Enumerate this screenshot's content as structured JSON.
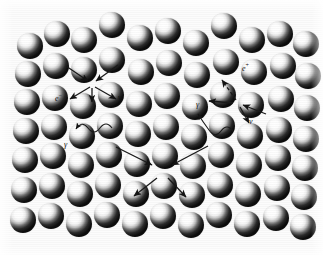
{
  "figure": {
    "background_color": "#fcfcfc",
    "width": 323,
    "height": 255,
    "sphere_color_light": "#ffffff",
    "sphere_color_dark": "#080808",
    "line_color": "#1a1a1a"
  },
  "medium": {
    "name": "sphere-lattice",
    "sphere_radius": 13,
    "spheres": [
      {
        "cx": 30,
        "cy": 46
      },
      {
        "cx": 57,
        "cy": 34
      },
      {
        "cx": 84,
        "cy": 40
      },
      {
        "cx": 112,
        "cy": 25
      },
      {
        "cx": 140,
        "cy": 38
      },
      {
        "cx": 168,
        "cy": 31
      },
      {
        "cx": 196,
        "cy": 43
      },
      {
        "cx": 224,
        "cy": 26
      },
      {
        "cx": 252,
        "cy": 40
      },
      {
        "cx": 280,
        "cy": 34
      },
      {
        "cx": 306,
        "cy": 44
      },
      {
        "cx": 28,
        "cy": 74
      },
      {
        "cx": 56,
        "cy": 66
      },
      {
        "cx": 84,
        "cy": 70
      },
      {
        "cx": 112,
        "cy": 60
      },
      {
        "cx": 141,
        "cy": 72
      },
      {
        "cx": 169,
        "cy": 63
      },
      {
        "cx": 197,
        "cy": 75
      },
      {
        "cx": 226,
        "cy": 62
      },
      {
        "cx": 254,
        "cy": 72
      },
      {
        "cx": 283,
        "cy": 66
      },
      {
        "cx": 308,
        "cy": 76
      },
      {
        "cx": 27,
        "cy": 102
      },
      {
        "cx": 55,
        "cy": 98
      },
      {
        "cx": 83,
        "cy": 106
      },
      {
        "cx": 111,
        "cy": 95
      },
      {
        "cx": 139,
        "cy": 104
      },
      {
        "cx": 167,
        "cy": 96
      },
      {
        "cx": 195,
        "cy": 107
      },
      {
        "cx": 223,
        "cy": 95
      },
      {
        "cx": 251,
        "cy": 105
      },
      {
        "cx": 281,
        "cy": 99
      },
      {
        "cx": 307,
        "cy": 108
      },
      {
        "cx": 26,
        "cy": 131
      },
      {
        "cx": 54,
        "cy": 127
      },
      {
        "cx": 82,
        "cy": 136
      },
      {
        "cx": 110,
        "cy": 126
      },
      {
        "cx": 138,
        "cy": 134
      },
      {
        "cx": 166,
        "cy": 127
      },
      {
        "cx": 194,
        "cy": 137
      },
      {
        "cx": 222,
        "cy": 126
      },
      {
        "cx": 250,
        "cy": 136
      },
      {
        "cx": 279,
        "cy": 130
      },
      {
        "cx": 306,
        "cy": 139
      },
      {
        "cx": 25,
        "cy": 160
      },
      {
        "cx": 53,
        "cy": 156
      },
      {
        "cx": 81,
        "cy": 165
      },
      {
        "cx": 109,
        "cy": 155
      },
      {
        "cx": 137,
        "cy": 164
      },
      {
        "cx": 165,
        "cy": 156
      },
      {
        "cx": 193,
        "cy": 166
      },
      {
        "cx": 221,
        "cy": 155
      },
      {
        "cx": 249,
        "cy": 165
      },
      {
        "cx": 278,
        "cy": 158
      },
      {
        "cx": 305,
        "cy": 168
      },
      {
        "cx": 24,
        "cy": 190
      },
      {
        "cx": 52,
        "cy": 186
      },
      {
        "cx": 80,
        "cy": 194
      },
      {
        "cx": 108,
        "cy": 185
      },
      {
        "cx": 136,
        "cy": 194
      },
      {
        "cx": 164,
        "cy": 186
      },
      {
        "cx": 192,
        "cy": 195
      },
      {
        "cx": 220,
        "cy": 185
      },
      {
        "cx": 248,
        "cy": 194
      },
      {
        "cx": 277,
        "cy": 188
      },
      {
        "cx": 304,
        "cy": 197
      },
      {
        "cx": 23,
        "cy": 220
      },
      {
        "cx": 51,
        "cy": 216
      },
      {
        "cx": 79,
        "cy": 224
      },
      {
        "cx": 107,
        "cy": 215
      },
      {
        "cx": 135,
        "cy": 224
      },
      {
        "cx": 163,
        "cy": 216
      },
      {
        "cx": 191,
        "cy": 225
      },
      {
        "cx": 219,
        "cy": 215
      },
      {
        "cx": 247,
        "cy": 224
      },
      {
        "cx": 276,
        "cy": 218
      },
      {
        "cx": 303,
        "cy": 227
      }
    ]
  },
  "interactions": {
    "left_vertex": {
      "x": 92,
      "y": 84,
      "incoming": [
        {
          "name": "incoming-upper-left",
          "x1": 66,
          "y1": 66,
          "x2": 88,
          "y2": 81
        },
        {
          "name": "incoming-upper-right",
          "x1": 118,
          "y1": 65,
          "x2": 96,
          "y2": 81
        }
      ],
      "outgoing": [
        {
          "name": "electron-track",
          "x1": 90,
          "y1": 87,
          "x2": 70,
          "y2": 99,
          "style": "solid"
        },
        {
          "name": "down-track",
          "x1": 92,
          "y1": 88,
          "x2": 92,
          "y2": 102,
          "style": "solid"
        },
        {
          "name": "neutrino-track",
          "x1": 95,
          "y1": 87,
          "x2": 116,
          "y2": 99,
          "style": "solid"
        }
      ]
    },
    "right_vertex": {
      "x": 238,
      "y": 103,
      "incoming": [
        {
          "name": "incoming-lower-right",
          "x1": 266,
          "y1": 114,
          "x2": 243,
          "y2": 105
        }
      ],
      "outgoing": [
        {
          "name": "positron-track",
          "x1": 236,
          "y1": 100,
          "x2": 222,
          "y2": 80,
          "style": "dashed"
        },
        {
          "name": "left-track",
          "x1": 233,
          "y1": 103,
          "x2": 209,
          "y2": 101,
          "style": "solid"
        },
        {
          "name": "neutrino-track",
          "x1": 240,
          "y1": 107,
          "x2": 249,
          "y2": 123,
          "style": "solid"
        }
      ]
    },
    "cascade_node": {
      "x": 162,
      "y": 170,
      "incoming": [
        {
          "name": "cascade-in-left",
          "x1": 116,
          "y1": 147,
          "x2": 152,
          "y2": 165
        },
        {
          "name": "cascade-in-right",
          "x1": 208,
          "y1": 146,
          "x2": 172,
          "y2": 165
        }
      ],
      "outgoing": [
        {
          "name": "cascade-out-left",
          "x1": 157,
          "y1": 178,
          "x2": 134,
          "y2": 196
        },
        {
          "name": "cascade-out-right",
          "x1": 168,
          "y1": 178,
          "x2": 186,
          "y2": 197
        }
      ]
    },
    "photons": [
      {
        "name": "photon-left",
        "label": "γ",
        "label_x": 64,
        "label_y": 141,
        "path": "M 112,128 Q 106,120 100,128 Q 94,136 88,128 Q 82,120 76,129"
      },
      {
        "name": "photon-right",
        "label": "γ",
        "label_x": 196,
        "label_y": 101,
        "path": "M 233,131 Q 227,123 221,131 Q 215,139 209,130 Q 203,122 198,114"
      }
    ]
  },
  "labels": [
    {
      "name": "electron-label",
      "text": "e",
      "sup": "−",
      "x": 55,
      "y": 92
    },
    {
      "name": "neutrino-label-left",
      "text": "ν",
      "sup": "",
      "x": 118,
      "y": 94
    },
    {
      "name": "positron-label",
      "text": "e",
      "sup": "+",
      "x": 242,
      "y": 62
    },
    {
      "name": "neutrino-label-right",
      "text": "ν",
      "sup": "",
      "x": 249,
      "y": 118
    }
  ]
}
